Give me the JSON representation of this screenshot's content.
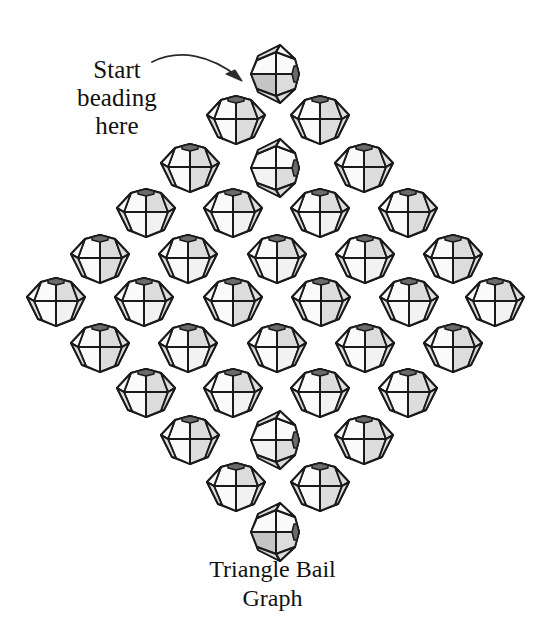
{
  "figure": {
    "title": "Triangle Bail Graph",
    "caption_line1": "Triangle Bail",
    "caption_line2": "Graph",
    "caption_text": "Triangle Bail\nGraph",
    "annotation_text": "Start\nbeading\nhere",
    "annotation_line1": "Start",
    "annotation_line2": "beading",
    "annotation_line3": "here",
    "arrow_name": "curved-arrow-pointing-to-first-bead",
    "background_color": "#ffffff",
    "ink_color": "#1a1a1a",
    "bead_fill_light": "#f2f2f2",
    "bead_fill_mid": "#dcdcdc",
    "bead_fill_dark": "#c4c4c4",
    "bead_count": 36,
    "bead_type": "bicone-faceted-bead",
    "row_counts": [
      1,
      2,
      3,
      4,
      5,
      6,
      5,
      4,
      3,
      2,
      1
    ]
  },
  "beads": [
    {
      "id": "bead-r1-c1",
      "row": 1,
      "col": 1,
      "x": 275,
      "y": 74,
      "orientation": "rotated",
      "shade": "dark"
    },
    {
      "id": "bead-r2-c1",
      "row": 2,
      "col": 1,
      "x": 236,
      "y": 120,
      "orientation": "upright",
      "shade": "mid"
    },
    {
      "id": "bead-r2-c2",
      "row": 2,
      "col": 2,
      "x": 320,
      "y": 120,
      "orientation": "upright",
      "shade": "mid"
    },
    {
      "id": "bead-r3-c1",
      "row": 3,
      "col": 1,
      "x": 190,
      "y": 168,
      "orientation": "upright",
      "shade": "mid"
    },
    {
      "id": "bead-r3-c2",
      "row": 3,
      "col": 2,
      "x": 275,
      "y": 168,
      "orientation": "rotated",
      "shade": "light"
    },
    {
      "id": "bead-r3-c3",
      "row": 3,
      "col": 3,
      "x": 364,
      "y": 168,
      "orientation": "upright",
      "shade": "mid"
    },
    {
      "id": "bead-r4-c1",
      "row": 4,
      "col": 1,
      "x": 146,
      "y": 213,
      "orientation": "upright",
      "shade": "light"
    },
    {
      "id": "bead-r4-c2",
      "row": 4,
      "col": 2,
      "x": 233,
      "y": 213,
      "orientation": "upright",
      "shade": "light"
    },
    {
      "id": "bead-r4-c3",
      "row": 4,
      "col": 3,
      "x": 320,
      "y": 213,
      "orientation": "upright",
      "shade": "light"
    },
    {
      "id": "bead-r4-c4",
      "row": 4,
      "col": 4,
      "x": 408,
      "y": 213,
      "orientation": "upright",
      "shade": "mid"
    },
    {
      "id": "bead-r5-c1",
      "row": 5,
      "col": 1,
      "x": 100,
      "y": 259,
      "orientation": "upright",
      "shade": "mid"
    },
    {
      "id": "bead-r5-c2",
      "row": 5,
      "col": 2,
      "x": 188,
      "y": 259,
      "orientation": "upright",
      "shade": "light"
    },
    {
      "id": "bead-r5-c3",
      "row": 5,
      "col": 3,
      "x": 277,
      "y": 259,
      "orientation": "upright",
      "shade": "light"
    },
    {
      "id": "bead-r5-c4",
      "row": 5,
      "col": 4,
      "x": 365,
      "y": 259,
      "orientation": "upright",
      "shade": "light"
    },
    {
      "id": "bead-r5-c5",
      "row": 5,
      "col": 5,
      "x": 453,
      "y": 259,
      "orientation": "upright",
      "shade": "mid"
    },
    {
      "id": "bead-r6-c1",
      "row": 6,
      "col": 1,
      "x": 56,
      "y": 302,
      "orientation": "upright",
      "shade": "light"
    },
    {
      "id": "bead-r6-c2",
      "row": 6,
      "col": 2,
      "x": 144,
      "y": 302,
      "orientation": "upright",
      "shade": "light"
    },
    {
      "id": "bead-r6-c3",
      "row": 6,
      "col": 3,
      "x": 233,
      "y": 302,
      "orientation": "upright",
      "shade": "mid"
    },
    {
      "id": "bead-r6-c4",
      "row": 6,
      "col": 4,
      "x": 321,
      "y": 302,
      "orientation": "upright",
      "shade": "mid"
    },
    {
      "id": "bead-r6-c5",
      "row": 6,
      "col": 5,
      "x": 409,
      "y": 302,
      "orientation": "upright",
      "shade": "light"
    },
    {
      "id": "bead-r6-c6",
      "row": 6,
      "col": 6,
      "x": 495,
      "y": 302,
      "orientation": "upright",
      "shade": "light"
    },
    {
      "id": "bead-r7-c1",
      "row": 7,
      "col": 1,
      "x": 100,
      "y": 348,
      "orientation": "upright",
      "shade": "mid"
    },
    {
      "id": "bead-r7-c2",
      "row": 7,
      "col": 2,
      "x": 188,
      "y": 348,
      "orientation": "upright",
      "shade": "light"
    },
    {
      "id": "bead-r7-c3",
      "row": 7,
      "col": 3,
      "x": 277,
      "y": 348,
      "orientation": "upright",
      "shade": "light"
    },
    {
      "id": "bead-r7-c4",
      "row": 7,
      "col": 4,
      "x": 365,
      "y": 348,
      "orientation": "upright",
      "shade": "light"
    },
    {
      "id": "bead-r7-c5",
      "row": 7,
      "col": 5,
      "x": 453,
      "y": 348,
      "orientation": "upright",
      "shade": "mid"
    },
    {
      "id": "bead-r8-c1",
      "row": 8,
      "col": 1,
      "x": 146,
      "y": 393,
      "orientation": "upright",
      "shade": "mid"
    },
    {
      "id": "bead-r8-c2",
      "row": 8,
      "col": 2,
      "x": 233,
      "y": 393,
      "orientation": "upright",
      "shade": "light"
    },
    {
      "id": "bead-r8-c3",
      "row": 8,
      "col": 3,
      "x": 320,
      "y": 393,
      "orientation": "upright",
      "shade": "light"
    },
    {
      "id": "bead-r8-c4",
      "row": 8,
      "col": 4,
      "x": 408,
      "y": 393,
      "orientation": "upright",
      "shade": "mid"
    },
    {
      "id": "bead-r9-c1",
      "row": 9,
      "col": 1,
      "x": 190,
      "y": 440,
      "orientation": "upright",
      "shade": "mid"
    },
    {
      "id": "bead-r9-c2",
      "row": 9,
      "col": 2,
      "x": 275,
      "y": 440,
      "orientation": "rotated",
      "shade": "light"
    },
    {
      "id": "bead-r9-c3",
      "row": 9,
      "col": 3,
      "x": 364,
      "y": 440,
      "orientation": "upright",
      "shade": "mid"
    },
    {
      "id": "bead-r10-c1",
      "row": 10,
      "col": 1,
      "x": 236,
      "y": 487,
      "orientation": "upright",
      "shade": "light"
    },
    {
      "id": "bead-r10-c2",
      "row": 10,
      "col": 2,
      "x": 320,
      "y": 487,
      "orientation": "upright",
      "shade": "mid"
    },
    {
      "id": "bead-r11-c1",
      "row": 11,
      "col": 1,
      "x": 275,
      "y": 532,
      "orientation": "rotated",
      "shade": "dark"
    }
  ]
}
